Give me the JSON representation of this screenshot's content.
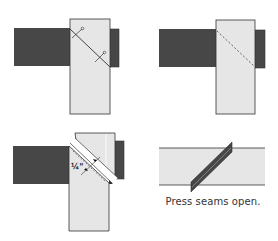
{
  "diagram": {
    "colors": {
      "dark_fabric": "#474747",
      "light_fabric": "#e6e6e6",
      "outline": "#333333",
      "background": "#ffffff"
    },
    "panels": [
      {
        "step": 1,
        "description": "Place strips right sides together at a right angle, draw diagonal and pin"
      },
      {
        "step": 2,
        "description": "Stitch on the diagonal line (dashed)"
      },
      {
        "step": 3,
        "description": "Trim seam allowance",
        "label": "¼\""
      },
      {
        "step": 4,
        "description": "Press seams open",
        "caption": "Press seams open."
      }
    ]
  }
}
